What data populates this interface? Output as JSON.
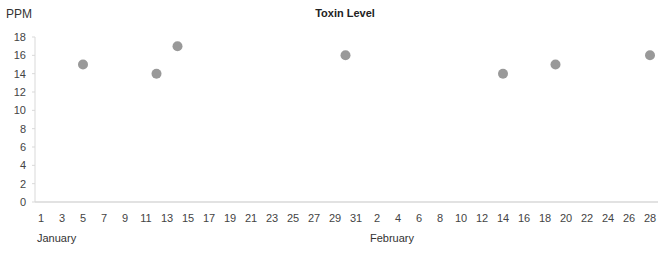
{
  "chart_data": {
    "type": "scatter",
    "title": "Toxin Level",
    "ylabel": "PPM",
    "xlabel": "",
    "ylim": [
      0,
      18
    ],
    "yticks": [
      0,
      2,
      4,
      6,
      8,
      10,
      12,
      14,
      16,
      18
    ],
    "grid": false,
    "legend": null,
    "x_month_labels": [
      "January",
      "February"
    ],
    "xticks": [
      "1",
      "3",
      "5",
      "7",
      "9",
      "11",
      "13",
      "15",
      "17",
      "19",
      "21",
      "23",
      "25",
      "27",
      "29",
      "31",
      "2",
      "4",
      "6",
      "8",
      "10",
      "12",
      "14",
      "16",
      "18",
      "20",
      "22",
      "24",
      "26",
      "28"
    ],
    "marker_color": "#999999",
    "points": [
      {
        "x": "Jan 5",
        "day_index": 4,
        "y": 15
      },
      {
        "x": "Jan 12",
        "day_index": 11,
        "y": 14
      },
      {
        "x": "Jan 14",
        "day_index": 13,
        "y": 17
      },
      {
        "x": "Jan 30",
        "day_index": 29,
        "y": 16
      },
      {
        "x": "Feb 14",
        "day_index": 44,
        "y": 14
      },
      {
        "x": "Feb 19",
        "day_index": 49,
        "y": 15
      },
      {
        "x": "Feb 28",
        "day_index": 58,
        "y": 16
      }
    ]
  }
}
